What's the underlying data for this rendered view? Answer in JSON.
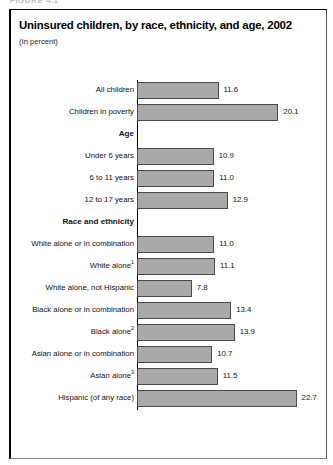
{
  "figure": {
    "number_fragment": "FIGURE 4.1",
    "title": "Uninsured children, by race, ethnicity, and age, 2002",
    "subtitle": "(In percent)"
  },
  "chart_data": {
    "type": "bar",
    "orientation": "horizontal",
    "title": "Uninsured children, by race, ethnicity, and age, 2002",
    "subtitle": "(In percent)",
    "xlabel": "",
    "ylabel": "",
    "xlim": [
      0,
      22.7
    ],
    "grid": false,
    "legend": null,
    "value_label_format": "one_decimal",
    "categories": [
      "All children",
      "Children in poverty",
      "Age",
      "Under 6 years",
      "6 to 11 years",
      "12 to 17 years",
      "Race and ethnicity",
      "White alone or in combination",
      "White alone¹",
      "White alone, not Hispanic",
      "Black alone or in combination",
      "Black alone²",
      "Asian alone or in combination",
      "Asian alone³",
      "Hispanic (of any race)"
    ],
    "values": [
      11.6,
      20.1,
      null,
      10.9,
      11.0,
      12.9,
      null,
      11.0,
      11.1,
      7.8,
      13.4,
      13.9,
      10.7,
      11.5,
      22.7
    ],
    "rows": [
      {
        "label": "All children",
        "sup": "",
        "value": 11.6,
        "value_text": "11.6",
        "group": false
      },
      {
        "label": "Children in poverty",
        "sup": "",
        "value": 20.1,
        "value_text": "20.1",
        "group": false
      },
      {
        "label": "Age",
        "sup": "",
        "value": null,
        "value_text": "",
        "group": true
      },
      {
        "label": "Under 6 years",
        "sup": "",
        "value": 10.9,
        "value_text": "10.9",
        "group": false
      },
      {
        "label": "6 to 11 years",
        "sup": "",
        "value": 11.0,
        "value_text": "11.0",
        "group": false
      },
      {
        "label": "12 to 17 years",
        "sup": "",
        "value": 12.9,
        "value_text": "12.9",
        "group": false
      },
      {
        "label": "Race and ethnicity",
        "sup": "",
        "value": null,
        "value_text": "",
        "group": true
      },
      {
        "label": "White alone or in combination",
        "sup": "",
        "value": 11.0,
        "value_text": "11.0",
        "group": false
      },
      {
        "label": "White alone",
        "sup": "1",
        "value": 11.1,
        "value_text": "11.1",
        "group": false
      },
      {
        "label": "White alone, not Hispanic",
        "sup": "",
        "value": 7.8,
        "value_text": "7.8",
        "group": false
      },
      {
        "label": "Black alone or in combination",
        "sup": "",
        "value": 13.4,
        "value_text": "13.4",
        "group": false
      },
      {
        "label": "Black alone",
        "sup": "2",
        "value": 13.9,
        "value_text": "13.9",
        "group": false
      },
      {
        "label": "Asian alone or in combination",
        "sup": "",
        "value": 10.7,
        "value_text": "10.7",
        "group": false
      },
      {
        "label": "Asian alone",
        "sup": "3",
        "value": 11.5,
        "value_text": "11.5",
        "group": false
      },
      {
        "label": "Hispanic (of any race)",
        "sup": "",
        "value": 22.7,
        "value_text": "22.7",
        "group": false
      }
    ]
  },
  "style": {
    "bar_fill": "#a9a9a9",
    "bar_stroke": "#4a4a4a",
    "frame_stroke": "#000000",
    "text_color": "#111111",
    "background": "#ffffff"
  },
  "geometry": {
    "axis_x": 137,
    "px_per_unit": 7.03,
    "row_height": 22,
    "first_row_top": 28,
    "bar_height": 17
  }
}
